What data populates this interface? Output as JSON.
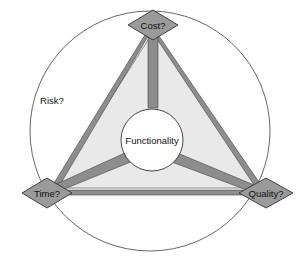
{
  "diagram": {
    "center": {
      "label": "Functionality",
      "cx": 152,
      "cy": 140,
      "r": 31,
      "fill": "#ffffff",
      "stroke": "#333333"
    },
    "outer_circle": {
      "label": "Risk?",
      "cx": 150,
      "cy": 131,
      "r": 120,
      "fill": "none",
      "stroke": "#555555"
    },
    "risk_label": {
      "text": "Risk?",
      "x": 52,
      "y": 101
    },
    "nodes": [
      {
        "id": "cost",
        "label": "Cost?",
        "cx": 153,
        "cy": 25,
        "rx": 25,
        "ry": 15,
        "fill": "#9a9a9a",
        "stroke": "#333333"
      },
      {
        "id": "time",
        "label": "Time?",
        "cx": 47,
        "cy": 193,
        "rx": 25,
        "ry": 15,
        "fill": "#9a9a9a",
        "stroke": "#333333"
      },
      {
        "id": "quality",
        "label": "Quality?",
        "cx": 266,
        "cy": 193,
        "rx": 27,
        "ry": 15,
        "fill": "#9a9a9a",
        "stroke": "#333333"
      }
    ],
    "triangle": {
      "points": "153,32 54,188 259,188",
      "fill": "#e9e9e9",
      "stroke": "#6f6f6f"
    },
    "edges": [
      {
        "id": "cost-time-edge",
        "from": "cost",
        "to": "time",
        "color": "#8d8d8d"
      },
      {
        "id": "cost-quality-edge",
        "from": "cost",
        "to": "quality",
        "color": "#8d8d8d"
      },
      {
        "id": "time-quality-edge",
        "from": "time",
        "to": "quality",
        "color": "#8d8d8d"
      }
    ],
    "spokes": [
      {
        "id": "center-cost-spoke",
        "to": "cost",
        "color": "#8d8d8d"
      },
      {
        "id": "center-time-spoke",
        "to": "time",
        "color": "#8d8d8d"
      },
      {
        "id": "center-quality-spoke",
        "to": "quality",
        "color": "#8d8d8d"
      }
    ],
    "colors": {
      "node_fill": "#9a9a9a",
      "band": "#8d8d8d",
      "triangle_fill": "#e9e9e9",
      "outline": "#333333",
      "circle_stroke": "#555555",
      "background": "#ffffff"
    }
  }
}
